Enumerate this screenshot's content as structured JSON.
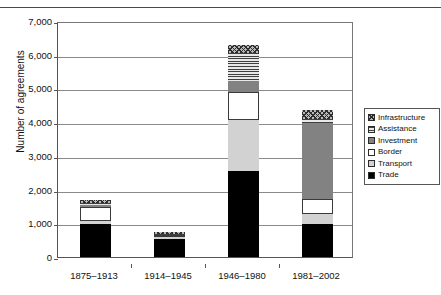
{
  "chart_data": {
    "type": "bar",
    "subtype": "stacked-bar",
    "title": "",
    "xlabel": "",
    "ylabel": "Number of agreements",
    "ylim": [
      0,
      7000
    ],
    "ytick_step": 1000,
    "ytick_labels": [
      "7,000",
      "6,000",
      "5,000",
      "4,000",
      "3,000",
      "2,000",
      "1,000",
      "0"
    ],
    "ytick_values": [
      7000,
      6000,
      5000,
      4000,
      3000,
      2000,
      1000,
      0
    ],
    "grid": "horizontal",
    "legend_position": "right",
    "categories": [
      "1875–1913",
      "1914–1945",
      "1946–1980",
      "1981–2002"
    ],
    "series": [
      {
        "name": "Trade",
        "fill": "solid-black",
        "color": "#000000",
        "values": [
          980,
          545,
          2560,
          975
        ]
      },
      {
        "name": "Transport",
        "fill": "solid-light-gray",
        "color": "#d2d2d2",
        "values": [
          75,
          35,
          1500,
          295
        ]
      },
      {
        "name": "Border",
        "fill": "white",
        "color": "#ffffff",
        "values": [
          425,
          60,
          830,
          455
        ]
      },
      {
        "name": "Investment",
        "fill": "solid-gray",
        "color": "#828282",
        "values": [
          70,
          25,
          345,
          2245
        ]
      },
      {
        "name": "Assistance",
        "fill": "horizontal-stripes",
        "color": "#3f3f3f",
        "values": [
          40,
          25,
          805,
          110
        ]
      },
      {
        "name": "Infrastructure",
        "fill": "checkerboard",
        "color": "#2e2e2e",
        "values": [
          105,
          65,
          265,
          275
        ]
      }
    ],
    "totals": [
      1695,
      755,
      6305,
      4355
    ]
  },
  "legend": {
    "items": [
      {
        "label": "Infrastructure",
        "swatch": "checkerboard-swatch"
      },
      {
        "label": "Assistance",
        "swatch": "horizontal-stripes-swatch"
      },
      {
        "label": "Investment",
        "swatch": "solid-gray-swatch"
      },
      {
        "label": "Border",
        "swatch": "white-swatch"
      },
      {
        "label": "Transport",
        "swatch": "light-gray-swatch"
      },
      {
        "label": "Trade",
        "swatch": "black-swatch"
      }
    ]
  }
}
